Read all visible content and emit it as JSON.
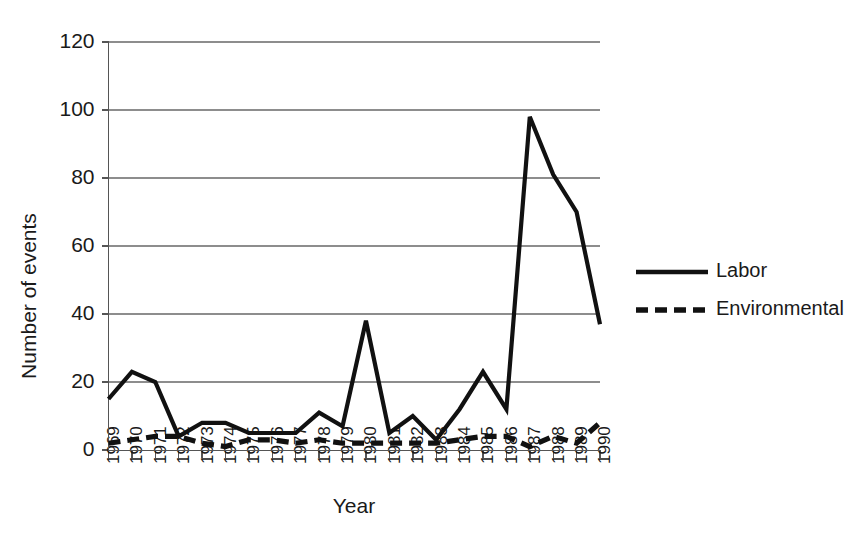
{
  "chart_data": {
    "type": "line",
    "title": "",
    "xlabel": "Year",
    "ylabel": "Number of events",
    "categories": [
      "1969",
      "1970",
      "1971",
      "1972",
      "1973",
      "1974",
      "1975",
      "1976",
      "1977",
      "1978",
      "1979",
      "1980",
      "1981",
      "1982",
      "1983",
      "1984",
      "1985",
      "1986",
      "1987",
      "1988",
      "1989",
      "1990"
    ],
    "series": [
      {
        "name": "Labor",
        "style": "solid",
        "values": [
          15,
          23,
          20,
          4,
          8,
          8,
          5,
          5,
          5,
          11,
          7,
          38,
          5,
          10,
          3,
          12,
          23,
          12,
          98,
          81,
          70,
          37
        ]
      },
      {
        "name": "Environmental",
        "style": "dashed",
        "values": [
          2,
          3,
          4,
          4,
          2,
          1,
          3,
          3,
          2,
          3,
          2,
          2,
          2,
          2,
          2,
          3,
          4,
          4,
          1,
          4,
          2,
          8
        ]
      }
    ],
    "ylim": [
      0,
      120
    ],
    "yticks": [
      0,
      20,
      40,
      60,
      80,
      100,
      120
    ],
    "ytick_labels": [
      "0",
      "20",
      "40",
      "60",
      "80",
      "100",
      "120"
    ],
    "grid": "horizontal",
    "legend_position": "right",
    "legend_entries": [
      "Labor",
      "Environmental"
    ],
    "colors": {
      "series": "#111111",
      "gridline": "#8d8d8d",
      "axis": "#555555",
      "background": "#ffffff",
      "text": "#1a1a1a"
    }
  },
  "axes": {
    "y_title": "Number of events",
    "x_title": "Year"
  }
}
